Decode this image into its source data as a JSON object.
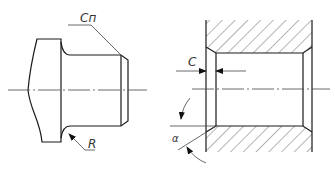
{
  "figures": {
    "shaft": {
      "chamfer_label": "Cп",
      "radius_label": "R"
    },
    "bore": {
      "chamfer_label": "C",
      "angle_label": "α"
    }
  },
  "colors": {
    "line": "#1a1a1a",
    "thin": "#444444",
    "background": "#ffffff"
  }
}
